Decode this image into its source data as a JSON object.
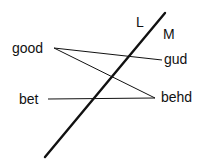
{
  "diagram": {
    "background": "#ffffff",
    "ink": "#111111",
    "labels": {
      "L": "L",
      "M": "M",
      "good": "good",
      "gud": "gud",
      "bet": "bet",
      "behd": "behd"
    },
    "boundary_line": {
      "x1": 45,
      "y1": 157,
      "x2": 165,
      "y2": 13,
      "stroke_width": 2.4
    },
    "connectors": [
      {
        "from": "good",
        "to": "gud",
        "x1": 54,
        "y1": 48,
        "x2": 162,
        "y2": 60
      },
      {
        "from": "good",
        "to": "behd",
        "x1": 54,
        "y1": 48,
        "x2": 155,
        "y2": 98
      },
      {
        "from": "bet",
        "to": "behd",
        "x1": 48,
        "y1": 99,
        "x2": 155,
        "y2": 98
      }
    ]
  }
}
